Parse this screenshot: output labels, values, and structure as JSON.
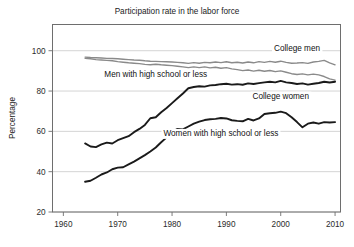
{
  "chart_data": {
    "type": "line",
    "title": "Participation rate in the labor force",
    "xlabel": "",
    "ylabel": "Percentage",
    "xlim": [
      1958,
      2011
    ],
    "ylim": [
      20,
      113
    ],
    "grid": true,
    "legend_position": "inline-annotations",
    "xticks": [
      "1960",
      "1970",
      "1980",
      "1990",
      "2000",
      "2010"
    ],
    "xtick_values": [
      1960,
      1970,
      1980,
      1990,
      2000,
      2010
    ],
    "yticks": [
      "20",
      "40",
      "60",
      "80",
      "100"
    ],
    "ytick_values": [
      20,
      40,
      60,
      80,
      100
    ],
    "series": [
      {
        "name": "College men",
        "color": "#8a8a8a",
        "label_x": 2003,
        "label_y": 100,
        "x": [
          1964,
          1965,
          1966,
          1967,
          1968,
          1969,
          1970,
          1971,
          1972,
          1973,
          1974,
          1975,
          1976,
          1977,
          1978,
          1979,
          1980,
          1981,
          1982,
          1983,
          1984,
          1985,
          1986,
          1987,
          1988,
          1989,
          1990,
          1991,
          1992,
          1993,
          1994,
          1995,
          1996,
          1997,
          1998,
          1999,
          2000,
          2001,
          2002,
          2003,
          2004,
          2005,
          2006,
          2007,
          2008,
          2009,
          2010
        ],
        "values": [
          96.8,
          96.6,
          96.5,
          96.4,
          96.2,
          96.1,
          96.0,
          95.8,
          95.6,
          95.4,
          95.3,
          95.0,
          94.8,
          94.7,
          94.6,
          94.5,
          94.4,
          94.2,
          94.0,
          93.7,
          94.1,
          93.8,
          94.2,
          94.0,
          94.4,
          94.1,
          94.5,
          94.0,
          94.3,
          93.9,
          94.4,
          94.0,
          94.6,
          94.2,
          94.7,
          94.3,
          94.8,
          94.2,
          93.8,
          93.9,
          94.1,
          93.7,
          94.4,
          94.7,
          95.2,
          94.0,
          93.0
        ]
      },
      {
        "name": "Men with high school or less",
        "color": "#8a8a8a",
        "label_x": 1977,
        "label_y": 87,
        "x": [
          1964,
          1965,
          1966,
          1967,
          1968,
          1969,
          1970,
          1971,
          1972,
          1973,
          1974,
          1975,
          1976,
          1977,
          1978,
          1979,
          1980,
          1981,
          1982,
          1983,
          1984,
          1985,
          1986,
          1987,
          1988,
          1989,
          1990,
          1991,
          1992,
          1993,
          1994,
          1995,
          1996,
          1997,
          1998,
          1999,
          2000,
          2001,
          2002,
          2003,
          2004,
          2005,
          2006,
          2007,
          2008,
          2009,
          2010
        ],
        "values": [
          96.2,
          96.0,
          95.6,
          95.4,
          95.2,
          95.0,
          94.6,
          94.3,
          94.0,
          93.8,
          93.6,
          93.2,
          93.0,
          93.3,
          93.0,
          92.8,
          92.6,
          92.3,
          92.0,
          91.6,
          92.0,
          91.6,
          92.0,
          91.5,
          91.8,
          91.3,
          91.6,
          91.0,
          90.6,
          90.1,
          90.4,
          89.9,
          90.3,
          89.8,
          90.2,
          89.6,
          90.0,
          89.3,
          88.6,
          88.2,
          88.5,
          88.0,
          88.4,
          88.0,
          87.2,
          86.0,
          85.4
        ]
      },
      {
        "name": "College women",
        "color": "#1a1a1a",
        "label_x": 2000,
        "label_y": 76,
        "x": [
          1964,
          1965,
          1966,
          1967,
          1968,
          1969,
          1970,
          1971,
          1972,
          1973,
          1974,
          1975,
          1976,
          1977,
          1978,
          1979,
          1980,
          1981,
          1982,
          1983,
          1984,
          1985,
          1986,
          1987,
          1988,
          1989,
          1990,
          1991,
          1992,
          1993,
          1994,
          1995,
          1996,
          1997,
          1998,
          1999,
          2000,
          2001,
          2002,
          2003,
          2004,
          2005,
          2006,
          2007,
          2008,
          2009,
          2010
        ],
        "values": [
          54.0,
          52.5,
          52.2,
          53.5,
          54.4,
          54.0,
          55.6,
          56.6,
          57.6,
          59.6,
          61.2,
          63.2,
          66.5,
          67.0,
          69.5,
          71.6,
          74.0,
          76.4,
          78.8,
          81.4,
          82.0,
          82.4,
          82.2,
          82.8,
          83.0,
          83.4,
          83.6,
          83.2,
          83.4,
          83.1,
          83.8,
          83.5,
          83.9,
          84.3,
          84.6,
          84.3,
          85.0,
          84.3,
          84.0,
          83.5,
          83.8,
          83.2,
          83.6,
          84.0,
          84.6,
          84.2,
          84.6
        ]
      },
      {
        "name": "Women with high school or less",
        "color": "#1a1a1a",
        "label_x": 1989,
        "label_y": 57.5,
        "x": [
          1964,
          1965,
          1966,
          1967,
          1968,
          1969,
          1970,
          1971,
          1972,
          1973,
          1974,
          1975,
          1976,
          1977,
          1978,
          1979,
          1980,
          1981,
          1982,
          1983,
          1984,
          1985,
          1986,
          1987,
          1988,
          1989,
          1990,
          1991,
          1992,
          1993,
          1994,
          1995,
          1996,
          1997,
          1998,
          1999,
          2000,
          2001,
          2002,
          2003,
          2004,
          2005,
          2006,
          2007,
          2008,
          2009,
          2010
        ],
        "values": [
          35.0,
          35.5,
          37.0,
          38.6,
          39.6,
          41.2,
          42.0,
          42.2,
          43.6,
          45.0,
          46.6,
          48.2,
          50.0,
          52.0,
          54.6,
          57.0,
          59.6,
          61.2,
          61.0,
          62.4,
          63.8,
          64.8,
          65.6,
          66.0,
          66.2,
          66.6,
          66.4,
          65.5,
          65.2,
          65.0,
          66.2,
          65.4,
          66.4,
          68.6,
          69.0,
          69.2,
          69.8,
          69.0,
          67.0,
          64.6,
          62.0,
          63.8,
          64.4,
          63.8,
          64.6,
          64.4,
          64.6
        ]
      }
    ]
  }
}
